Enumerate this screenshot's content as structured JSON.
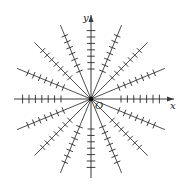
{
  "diagram": {
    "type": "direction-field",
    "labels": {
      "x_axis": "x",
      "y_axis": "y",
      "origin": "O"
    },
    "origin_px": [
      91,
      99
    ],
    "ray_angles_deg": [
      0,
      22.5,
      45,
      67.5,
      90,
      112.5,
      135,
      157.5
    ],
    "ray_half_length_px": 80,
    "ticks_per_half_ray": 7,
    "tick_start_offset_px": 30,
    "tick_spacing_px": 6.4,
    "tick_half_length_px": 3.5,
    "colors": {
      "line": "#3a3a3a",
      "tick": "#2a2a2a",
      "origin_dot": "#111111",
      "background": "#ffffff"
    }
  }
}
